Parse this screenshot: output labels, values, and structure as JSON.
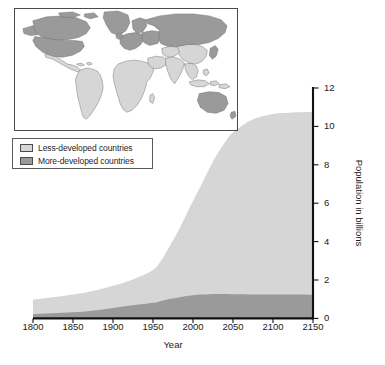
{
  "figure": {
    "background_color": "#ffffff"
  },
  "map_inset": {
    "name": "world-map-inset",
    "more_developed_color": "#9a9a9a",
    "less_developed_color": "#d6d6d6",
    "outline_color": "#6b6b6b",
    "border_color": "#4a4a4a",
    "ocean_color": "#ffffff",
    "more_developed_regions": [
      "North America",
      "Greenland",
      "Europe",
      "Russia",
      "Japan",
      "Australia",
      "New Zealand"
    ],
    "less_developed_regions": [
      "Latin America",
      "Africa",
      "Middle East",
      "South Asia",
      "Southeast Asia",
      "China"
    ]
  },
  "legend": {
    "position": "upper-left",
    "items": [
      {
        "label": "Less-developed countries",
        "color": "#d6d6d6",
        "swatch": "light-gray-swatch"
      },
      {
        "label": "More-developed countries",
        "color": "#9a9a9a",
        "swatch": "dark-gray-swatch"
      }
    ]
  },
  "chart_data": {
    "type": "area",
    "stacked": true,
    "title": "",
    "xlabel": "Year",
    "ylabel": "Population in billions",
    "xlim": [
      1800,
      2150
    ],
    "ylim": [
      0,
      12
    ],
    "xticks": [
      1800,
      1850,
      1900,
      1950,
      2000,
      2050,
      2100,
      2150
    ],
    "yticks": [
      0,
      2,
      4,
      6,
      8,
      10,
      12
    ],
    "xtick_labels": [
      "1800",
      "1850",
      "1900",
      "1950",
      "2000",
      "2050",
      "2100",
      "2150"
    ],
    "ytick_labels": [
      "0",
      "2",
      "4",
      "6",
      "8",
      "10",
      "12"
    ],
    "y_axis_position": "right",
    "grid": false,
    "legend_position": "upper-left",
    "x": [
      1800,
      1825,
      1850,
      1875,
      1900,
      1925,
      1950,
      1960,
      1970,
      1980,
      1990,
      2000,
      2010,
      2020,
      2030,
      2040,
      2050,
      2075,
      2100,
      2125,
      2150
    ],
    "series": [
      {
        "name": "More-developed countries",
        "color": "#9a9a9a",
        "values": [
          0.23,
          0.27,
          0.32,
          0.4,
          0.54,
          0.68,
          0.81,
          0.91,
          1.01,
          1.08,
          1.15,
          1.21,
          1.24,
          1.26,
          1.27,
          1.27,
          1.26,
          1.25,
          1.24,
          1.24,
          1.23
        ]
      },
      {
        "name": "Less-developed countries",
        "color": "#d6d6d6",
        "values": [
          0.75,
          0.83,
          0.92,
          1.03,
          1.16,
          1.35,
          1.71,
          2.09,
          2.68,
          3.35,
          4.12,
          4.9,
          5.68,
          6.51,
          7.26,
          7.9,
          8.42,
          9.12,
          9.41,
          9.49,
          9.52
        ]
      }
    ],
    "total_values": [
      0.98,
      1.1,
      1.24,
      1.43,
      1.7,
      2.03,
      2.52,
      3.0,
      3.69,
      4.43,
      5.27,
      6.11,
      6.92,
      7.77,
      8.53,
      9.17,
      9.68,
      10.37,
      10.65,
      10.73,
      10.75
    ],
    "annotations": []
  },
  "axes": {
    "axis_color": "#111111",
    "tick_color": "#111111"
  }
}
